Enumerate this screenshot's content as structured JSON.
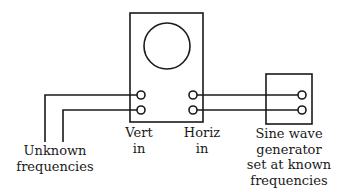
{
  "diagram": {
    "colors": {
      "line": "#1a1a1a",
      "background": "#ffffff"
    },
    "oscilloscope": {
      "box": {
        "x": 130,
        "y": 13,
        "w": 73,
        "h": 109
      },
      "screen": {
        "cx": 167,
        "cy": 46,
        "r": 23
      },
      "terminals": [
        {
          "name": "vert-in-1",
          "x": 141,
          "y": 95
        },
        {
          "name": "vert-in-2",
          "x": 141,
          "y": 110
        },
        {
          "name": "horiz-in-1",
          "x": 193,
          "y": 95
        },
        {
          "name": "horiz-in-2",
          "x": 193,
          "y": 110
        }
      ]
    },
    "generator": {
      "box": {
        "x": 266,
        "y": 74,
        "w": 46,
        "h": 50
      },
      "terminals": [
        {
          "name": "gen-out-1",
          "x": 302,
          "y": 95
        },
        {
          "name": "gen-out-2",
          "x": 302,
          "y": 110
        }
      ]
    },
    "labels": {
      "unknown": {
        "line1": "Unknown",
        "line2": "frequencies"
      },
      "vert": {
        "line1": "Vert",
        "line2": "in"
      },
      "horiz": {
        "line1": "Horiz",
        "line2": "in"
      },
      "generator": {
        "line1": "Sine wave",
        "line2": "generator",
        "line3": "set at known",
        "line4": "frequencies"
      }
    }
  }
}
